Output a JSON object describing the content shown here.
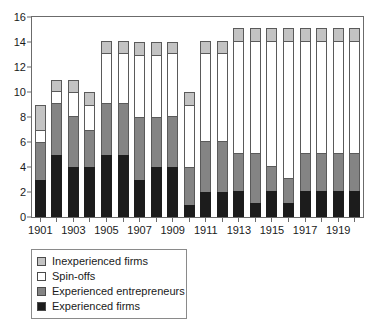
{
  "chart_data": {
    "type": "bar",
    "subtype": "stacked-vertical",
    "title": "",
    "subtitle": "",
    "xlabel": "",
    "ylabel": "",
    "ylim": [
      0,
      16
    ],
    "yticks": [
      0,
      2,
      4,
      6,
      8,
      10,
      12,
      14,
      16
    ],
    "ytick_labels": [
      "0",
      "2",
      "4",
      "6",
      "8",
      "10",
      "12",
      "14",
      "16"
    ],
    "grid": false,
    "legend_position": "below-left",
    "categories": [
      "1901",
      "1902",
      "1903",
      "1904",
      "1905",
      "1906",
      "1907",
      "1908",
      "1909",
      "1910",
      "1911",
      "1912",
      "1913",
      "1914",
      "1915",
      "1916",
      "1917",
      "1918",
      "1919",
      "1920"
    ],
    "xtick_labels": [
      "1901",
      "1903",
      "1905",
      "1907",
      "1909",
      "1911",
      "1913",
      "1915",
      "1917",
      "1919"
    ],
    "xtick_label_categories": [
      "1901",
      "1903",
      "1905",
      "1907",
      "1909",
      "1911",
      "1913",
      "1915",
      "1917",
      "1919"
    ],
    "series": [
      {
        "name": "Experienced firms",
        "color": "#1c1c1c",
        "values": [
          3,
          5,
          4,
          4,
          5,
          5,
          3,
          4,
          4,
          1,
          2,
          2,
          2.1,
          1.1,
          2.1,
          1.1,
          2.1,
          2.1,
          2.1,
          2.1
        ]
      },
      {
        "name": "Experienced entrepreneurs",
        "color": "#848484",
        "values": [
          3,
          4.1,
          4.1,
          3,
          4.1,
          4.1,
          5,
          4,
          4.1,
          3,
          4.1,
          4.1,
          3,
          4,
          2,
          2,
          3,
          3,
          3,
          3
        ]
      },
      {
        "name": "Spin-offs",
        "color": "#ffffff",
        "values": [
          1,
          1,
          1.9,
          2,
          4,
          4,
          5,
          5,
          5,
          5,
          7,
          7,
          9,
          9,
          10,
          11,
          9,
          9,
          9,
          9
        ]
      },
      {
        "name": "Inexperienced firms",
        "color": "#c3c3c3",
        "values": [
          2,
          0.9,
          1,
          1,
          1,
          1,
          1,
          1,
          0.9,
          1,
          1,
          1,
          1,
          1,
          1,
          1,
          1,
          1,
          1,
          1
        ]
      }
    ],
    "totals": [
      9,
      11,
      11,
      10,
      14.1,
      14.1,
      14,
      14,
      14,
      10,
      14.1,
      14.1,
      15.1,
      15.1,
      15.1,
      15.1,
      15.1,
      15.1,
      15.1,
      15.1
    ]
  },
  "legend": {
    "items": [
      {
        "label": "Inexperienced firms",
        "color": "#c3c3c3"
      },
      {
        "label": "Spin-offs",
        "color": "#ffffff"
      },
      {
        "label": "Experienced entrepreneurs",
        "color": "#848484"
      },
      {
        "label": "Experienced firms",
        "color": "#1c1c1c"
      }
    ]
  },
  "colors": {
    "axis": "#6b6b6b",
    "segment_border": "#5a5a5a",
    "text": "#1a1a1a",
    "background": "#ffffff"
  }
}
